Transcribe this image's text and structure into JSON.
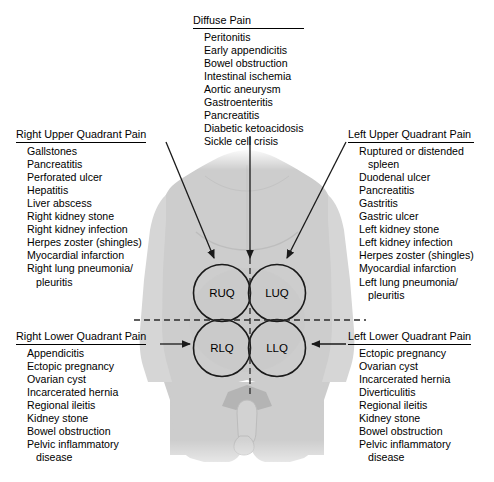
{
  "diagram": {
    "body_fill": "#cdcdcd",
    "line_color": "#1a1a1a",
    "quadrants": [
      {
        "code": "RUQ",
        "cx": 222,
        "cy": 293
      },
      {
        "code": "LUQ",
        "cx": 277,
        "cy": 293
      },
      {
        "code": "RLQ",
        "cx": 222,
        "cy": 348
      },
      {
        "code": "LLQ",
        "cx": 277,
        "cy": 348
      }
    ]
  },
  "blocks": {
    "diffuse": {
      "heading": "Diffuse Pain",
      "items": [
        "Peritonitis",
        "Early appendicitis",
        "Bowel obstruction",
        "Intestinal ischemia",
        "Aortic aneurysm",
        "Gastroenteritis",
        "Pancreatitis",
        "Diabetic ketoacidosis",
        "Sickle cell crisis"
      ]
    },
    "right_upper": {
      "heading": "Right Upper Quadrant Pain",
      "items": [
        "Gallstones",
        "Pancreatitis",
        "Perforated ulcer",
        "Hepatitis",
        "Liver abscess",
        "Right kidney stone",
        "Right kidney infection",
        "Herpes zoster (shingles)",
        "Myocardial infarction",
        "Right lung pneumonia/"
      ],
      "continuation": "pleuritis"
    },
    "left_upper": {
      "heading": "Left Upper Quadrant Pain",
      "items": [
        "Ruptured or distended",
        "Duodenal ulcer",
        "Pancreatitis",
        "Gastritis",
        "Gastric ulcer",
        "Left kidney stone",
        "Left kidney infection",
        "Herpes zoster (shingles)",
        "Myocardial infarction",
        "Left lung pneumonia/"
      ],
      "continuation_first": "spleen",
      "continuation": "pleuritis"
    },
    "right_lower": {
      "heading": "Right Lower Quadrant Pain",
      "items": [
        "Appendicitis",
        "Ectopic pregnancy",
        "Ovarian cyst",
        "Incarcerated hernia",
        "Regional ileitis",
        "Kidney stone",
        "Bowel obstruction",
        "Pelvic inflammatory"
      ],
      "continuation": "disease"
    },
    "left_lower": {
      "heading": "Left Lower Quadrant Pain",
      "items": [
        "Ectopic pregnancy",
        "Ovarian cyst",
        "Incarcerated hernia",
        "Diverticulitis",
        "Regional ileitis",
        "Kidney stone",
        "Bowel obstruction",
        "Pelvic inflammatory"
      ],
      "continuation": "disease"
    }
  }
}
